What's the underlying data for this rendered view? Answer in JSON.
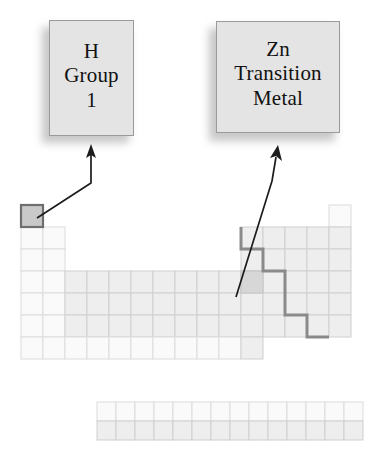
{
  "figure": {
    "type": "periodic-table-callout-diagram",
    "background_color": "#ffffff"
  },
  "callouts": [
    {
      "id": "h",
      "lines": [
        "H",
        "Group",
        "1"
      ],
      "line1": "H",
      "line2": "Group",
      "line3": "1",
      "fill_color": "#e4e4e4",
      "border_color": "#9a9a9a",
      "text_color": "#111111",
      "points_to": "hydrogen-cell"
    },
    {
      "id": "zn",
      "lines": [
        "Zn",
        "Transition",
        "Metal"
      ],
      "line1": "Zn",
      "line2": "Transition",
      "line3": "Metal",
      "fill_color": "#e4e4e4",
      "border_color": "#9a9a9a",
      "text_color": "#111111",
      "points_to": "zinc-cell"
    }
  ],
  "table": {
    "rows": 7,
    "columns": 18,
    "cell_size": 22,
    "origin_x": 21,
    "origin_y": 205,
    "cell_fill": "#eeeeee",
    "cell_stroke": "#cfcfcf",
    "highlight_fill": "#c9c9c9",
    "highlight_stroke": "#6e6e6e",
    "fblock_rows": 2,
    "fblock_columns": 14,
    "fblock_origin_x": 97,
    "fblock_origin_y": 402,
    "metalloid_line_color": "#8a8a8a",
    "highlighted_cells": [
      "hydrogen-cell",
      "zinc-cell"
    ]
  },
  "arrows": {
    "color": "#1c1c1c",
    "count": 2
  }
}
